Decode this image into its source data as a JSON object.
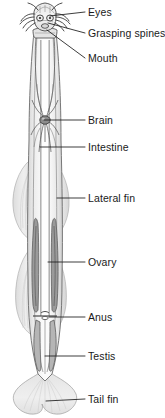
{
  "figure": {
    "width": 165,
    "height": 418,
    "background_color": "#ffffff",
    "line_color": "#1a1a1a",
    "body_fill_color": "#f2f2f2",
    "fin_fill_color": "#e2e2e2",
    "organ_color": "#6e6e6e"
  },
  "labels": [
    {
      "id": "eyes",
      "text": "Eyes",
      "x": 88,
      "y": 7,
      "leader": {
        "x1": 85,
        "y1": 12,
        "x2": 50,
        "y2": 16
      }
    },
    {
      "id": "grasping_spines",
      "text": "Grasping spines",
      "x": 88,
      "y": 28,
      "leader": {
        "x1": 85,
        "y1": 33,
        "x2": 48,
        "y2": 23
      }
    },
    {
      "id": "mouth",
      "text": "Mouth",
      "x": 88,
      "y": 53,
      "leader": {
        "x1": 85,
        "y1": 58,
        "x2": 47,
        "y2": 30
      }
    },
    {
      "id": "brain",
      "text": "Brain",
      "x": 88,
      "y": 115,
      "leader": {
        "x1": 85,
        "y1": 120,
        "x2": 44,
        "y2": 120
      }
    },
    {
      "id": "intestine",
      "text": "Intestine",
      "x": 88,
      "y": 142,
      "leader": {
        "x1": 85,
        "y1": 147,
        "x2": 40,
        "y2": 147
      }
    },
    {
      "id": "lateral_fin",
      "text": "Lateral fin",
      "x": 88,
      "y": 193,
      "leader": {
        "x1": 85,
        "y1": 198,
        "x2": 57,
        "y2": 198
      }
    },
    {
      "id": "ovary",
      "text": "Ovary",
      "x": 88,
      "y": 257,
      "leader": {
        "x1": 85,
        "y1": 262,
        "x2": 48,
        "y2": 262
      }
    },
    {
      "id": "anus",
      "text": "Anus",
      "x": 88,
      "y": 312,
      "leader": {
        "x1": 85,
        "y1": 317,
        "x2": 49,
        "y2": 317
      }
    },
    {
      "id": "testis",
      "text": "Testis",
      "x": 88,
      "y": 351,
      "leader": {
        "x1": 85,
        "y1": 356,
        "x2": 45,
        "y2": 356
      }
    },
    {
      "id": "tail_fin",
      "text": "Tail fin",
      "x": 88,
      "y": 394,
      "leader": {
        "x1": 85,
        "y1": 399,
        "x2": 46,
        "y2": 401
      }
    }
  ]
}
